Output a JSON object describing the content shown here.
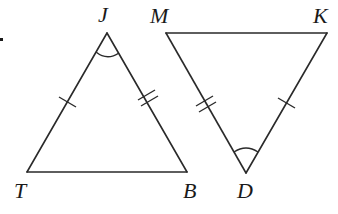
{
  "figure": {
    "stray_mark": ".",
    "triangles": [
      {
        "name": "JTB",
        "vertices": {
          "J": {
            "label": "J",
            "x": 107,
            "y": 33
          },
          "T": {
            "label": "T",
            "x": 27,
            "y": 172
          },
          "B": {
            "label": "B",
            "x": 187,
            "y": 172
          }
        },
        "markings": {
          "JT": "single-tick",
          "JB": "double-tick",
          "angle_J": "single-arc"
        }
      },
      {
        "name": "MKD",
        "vertices": {
          "M": {
            "label": "M",
            "x": 166,
            "y": 33
          },
          "K": {
            "label": "K",
            "x": 327,
            "y": 33
          },
          "D": {
            "label": "D",
            "x": 246,
            "y": 173
          }
        },
        "markings": {
          "MD": "double-tick",
          "KD": "single-tick",
          "angle_D": "single-arc"
        }
      }
    ],
    "labels": {
      "J": "J",
      "T": "T",
      "B": "B",
      "M": "M",
      "K": "K",
      "D": "D"
    },
    "stroke_color": "#2a2a2a"
  }
}
